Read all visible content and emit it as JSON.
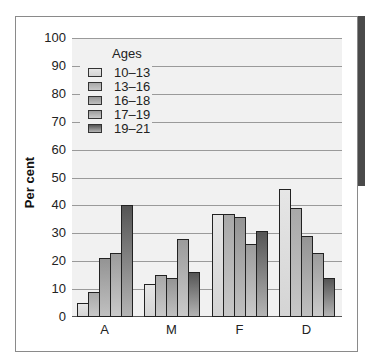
{
  "chart_data": {
    "type": "bar",
    "title": "",
    "xlabel": "",
    "ylabel": "Per cent",
    "ylim": [
      0,
      100
    ],
    "yticks": [
      0,
      10,
      20,
      30,
      40,
      50,
      60,
      70,
      80,
      90,
      100
    ],
    "grid": true,
    "legend_title": "Ages",
    "legend_position": "upper left",
    "categories": [
      "A",
      "M",
      "F",
      "D"
    ],
    "series": [
      {
        "name": "10–13",
        "values": [
          5,
          12,
          37,
          46
        ]
      },
      {
        "name": "13–16",
        "values": [
          9,
          15,
          37,
          39
        ]
      },
      {
        "name": "16–18",
        "values": [
          21,
          14,
          36,
          29
        ]
      },
      {
        "name": "17–19",
        "values": [
          23,
          28,
          26,
          23
        ]
      },
      {
        "name": "19–21",
        "values": [
          40,
          16,
          31,
          14
        ]
      }
    ]
  }
}
